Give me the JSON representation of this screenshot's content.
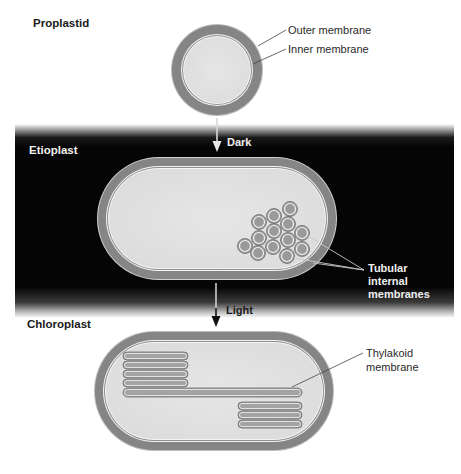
{
  "stages": {
    "proplastid": {
      "title": "Proplastid",
      "labels": {
        "outer": "Outer membrane",
        "inner": "Inner membrane"
      }
    },
    "etioplast": {
      "title": "Etioplast",
      "transition_label": "Dark",
      "labels": {
        "tubular_line1": "Tubular",
        "tubular_line2": "internal",
        "tubular_line3": "membranes"
      }
    },
    "chloroplast": {
      "title": "Chloroplast",
      "transition_label": "Light",
      "labels": {
        "thylakoid_line1": "Thylakoid",
        "thylakoid_line2": "membrane"
      }
    }
  },
  "colors": {
    "membrane_ring": "#858585",
    "interior": "#e2e2e2",
    "membrane_edge": "#f4f4f4",
    "dark_band": "#050505",
    "tubule_fill": "#9a9a9a",
    "thylakoid_fill": "#a3a3a3"
  }
}
